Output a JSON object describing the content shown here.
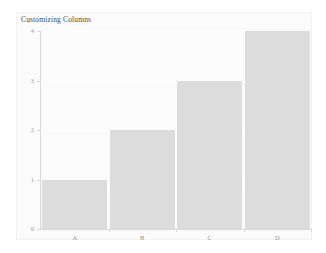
{
  "figure": {
    "title": "Customizing Columns",
    "background_color": "#ffffff",
    "panel_color": "#fbfbfb",
    "bar_color": "#dcdcdc",
    "axis_color": "#d9d9d9",
    "tick_label_color": "#9a9a9a",
    "title_color": "#4a4a4a",
    "gridline_color": "#ffffff"
  },
  "chart_data": {
    "type": "bar",
    "title": "Customizing Columns",
    "xlabel": "",
    "ylabel": "",
    "categories": [
      "A",
      "B",
      "C",
      "D"
    ],
    "values": [
      1,
      2,
      3,
      4
    ],
    "series": [
      {
        "name": "value",
        "values": [
          1,
          2,
          3,
          4
        ]
      }
    ],
    "ylim": [
      0,
      4
    ],
    "yticks": [
      0,
      1,
      2,
      3,
      4
    ],
    "ytick_labels": [
      "0",
      "1",
      "2",
      "3",
      "4"
    ],
    "xtick_labels": [
      "A",
      "B",
      "C",
      "D"
    ],
    "grid": true,
    "grid_axis": "y",
    "legend": false,
    "legend_position": "none",
    "bar_width_fraction": 0.97,
    "orientation": "vertical"
  }
}
